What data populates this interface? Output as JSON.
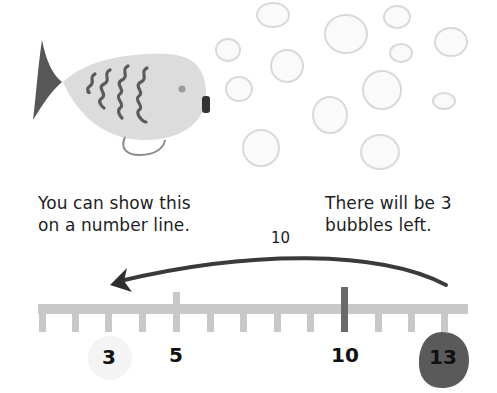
{
  "captions": {
    "left": [
      "You can show this",
      "on a number line."
    ],
    "right": [
      "There will be 3",
      "bubbles left."
    ]
  },
  "jump": {
    "label": "10",
    "from": 13,
    "to": 3,
    "direction": "left"
  },
  "number_line": {
    "start": 2,
    "end": 14,
    "ticks": [
      2,
      3,
      4,
      5,
      6,
      7,
      8,
      9,
      10,
      11,
      12,
      13
    ],
    "labels": [
      {
        "value": 3,
        "text": "3",
        "highlight": "light-circle"
      },
      {
        "value": 5,
        "text": "5",
        "highlight": "none"
      },
      {
        "value": 10,
        "text": "10",
        "highlight": "none"
      },
      {
        "value": 13,
        "text": "13",
        "highlight": "dark-blob"
      }
    ],
    "emphasized_ticks": [
      5,
      10
    ]
  },
  "illustration": {
    "subject": "fish",
    "bubble_count": 13
  },
  "colors": {
    "line": "#c8c8c8",
    "tick10": "#6a6a6a",
    "arrow": "#3c3c3c",
    "fish_body": "#dcdcdc",
    "fish_tail": "#555555",
    "bubble_stroke": "#d8d8d8",
    "blob13": "#5a5a5a",
    "circle3": "#f4f4f4"
  }
}
